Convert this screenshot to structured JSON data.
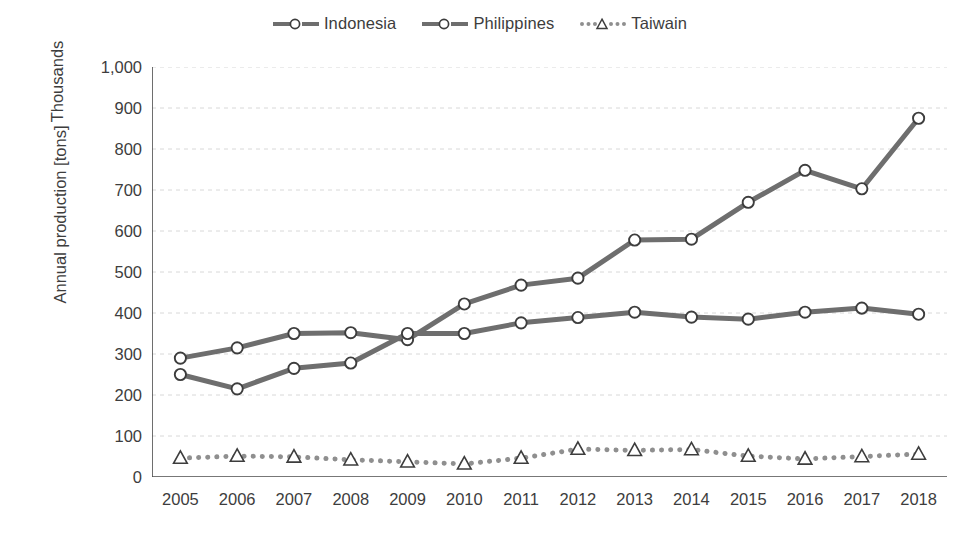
{
  "chart_data": {
    "type": "line",
    "title": "",
    "xlabel": "",
    "ylabel": "Annual production [tons]",
    "y_units_label": "Thousands",
    "x": [
      2005,
      2006,
      2007,
      2008,
      2009,
      2010,
      2011,
      2012,
      2013,
      2014,
      2015,
      2016,
      2017,
      2018
    ],
    "categories": [
      "2005",
      "2006",
      "2007",
      "2008",
      "2009",
      "2010",
      "2011",
      "2012",
      "2013",
      "2014",
      "2015",
      "2016",
      "2017",
      "2018"
    ],
    "ylim": [
      0,
      1000
    ],
    "yticks": [
      0,
      100,
      200,
      300,
      400,
      500,
      600,
      700,
      800,
      900,
      1000
    ],
    "ytick_labels": [
      "0",
      "100",
      "200",
      "300",
      "400",
      "500",
      "600",
      "700",
      "800",
      "900",
      "1,000"
    ],
    "y_minor_tick_step": 20,
    "grid": "horizontal-dashed-light",
    "legend_position": "top-center",
    "series": [
      {
        "name": "Indonesia",
        "color": "#6e6e6e",
        "line_style": "solid",
        "marker": "circle",
        "values": [
          290,
          315,
          350,
          352,
          335,
          422,
          468,
          485,
          578,
          580,
          670,
          748,
          703,
          875
        ]
      },
      {
        "name": "Philippines",
        "color": "#6e6e6e",
        "line_style": "solid",
        "marker": "circle",
        "values": [
          250,
          215,
          265,
          278,
          350,
          350,
          376,
          389,
          402,
          390,
          385,
          402,
          412,
          397
        ]
      },
      {
        "name": "Taiwain",
        "color": "#8f8f8f",
        "line_style": "dotted",
        "marker": "triangle",
        "values": [
          46,
          51,
          49,
          42,
          37,
          32,
          46,
          68,
          65,
          67,
          51,
          44,
          50,
          56
        ]
      }
    ]
  },
  "colors": {
    "axis": "#4a4a4a",
    "grid": "#d8d8d8",
    "text": "#3d3d3d",
    "solid_series": "#6e6e6e",
    "dotted_series": "#8f8f8f",
    "background": "#ffffff"
  }
}
